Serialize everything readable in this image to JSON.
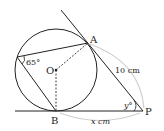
{
  "diagram": {
    "points": {
      "A": "A",
      "B": "B",
      "O": "O",
      "P": "P"
    },
    "angle_label": "65°",
    "angle_y_label": "y°",
    "length_AP": "10 cm",
    "length_BP": "x cm",
    "colors": {
      "line": "#222222",
      "arc": "#c8c8c8",
      "dash": "#444444"
    }
  }
}
